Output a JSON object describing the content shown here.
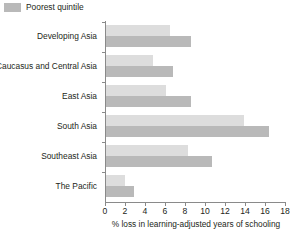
{
  "legend": {
    "entries": [
      {
        "label": "Poorest quintile",
        "color": "#b9b9b9"
      }
    ]
  },
  "chart_data": {
    "type": "bar",
    "orientation": "horizontal",
    "title": "",
    "subtitle": "",
    "xlabel": "% loss in learning-adjusted years of schooling",
    "ylabel": "",
    "xlim": [
      0,
      18
    ],
    "xticks": [
      0,
      2,
      4,
      6,
      8,
      10,
      12,
      14,
      16,
      18
    ],
    "xtick_labels": [
      "0",
      "2",
      "4",
      "6",
      "8",
      "10",
      "12",
      "14",
      "16",
      "18"
    ],
    "grid": false,
    "legend_position": "top-left",
    "categories": [
      "Developing Asia",
      "Caucasus and Central Asia",
      "East Asia",
      "South Asia",
      "Southeast Asia",
      "The Pacific"
    ],
    "series": [
      {
        "name": "",
        "color": "#dddddd",
        "values": [
          6.4,
          4.7,
          6.0,
          13.8,
          8.2,
          1.9
        ]
      },
      {
        "name": "Poorest quintile",
        "color": "#b9b9b9",
        "values": [
          8.5,
          6.7,
          8.5,
          16.3,
          10.6,
          2.8
        ]
      }
    ]
  }
}
